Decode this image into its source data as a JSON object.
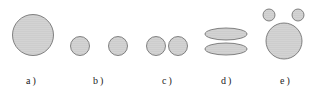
{
  "figure": {
    "panels": [
      {
        "id": "a",
        "label": "a )"
      },
      {
        "id": "b",
        "label": "b )"
      },
      {
        "id": "c",
        "label": "c )"
      },
      {
        "id": "d",
        "label": "d )"
      },
      {
        "id": "e",
        "label": "e )"
      }
    ],
    "colors": {
      "stroke": "#666666",
      "fill_dot": "#8a8a8a",
      "fill_bg": "#e6e6e6"
    }
  }
}
